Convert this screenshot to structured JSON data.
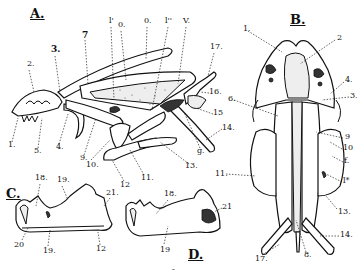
{
  "figures": {
    "A": {
      "title": "A.",
      "labels": [
        {
          "id": "a1",
          "text": "1.",
          "x": 8,
          "y": 145
        },
        {
          "id": "a2",
          "text": "2.",
          "x": 27,
          "y": 63
        },
        {
          "id": "a3",
          "text": "3.",
          "x": 52,
          "y": 47,
          "bold": true
        },
        {
          "id": "a4",
          "text": "4.",
          "x": 56,
          "y": 147
        },
        {
          "id": "a5",
          "text": "5.",
          "x": 35,
          "y": 151
        },
        {
          "id": "a7",
          "text": "7",
          "x": 82,
          "y": 34,
          "bold": true
        },
        {
          "id": "a9",
          "text": "9.",
          "x": 81,
          "y": 158
        },
        {
          "id": "a10",
          "text": "10.",
          "x": 87,
          "y": 163
        },
        {
          "id": "a11",
          "text": "11.",
          "x": 142,
          "y": 178
        },
        {
          "id": "a12",
          "text": "12",
          "x": 121,
          "y": 184
        },
        {
          "id": "a13",
          "text": "13.",
          "x": 186,
          "y": 166
        },
        {
          "id": "a14",
          "text": "14.",
          "x": 223,
          "y": 127
        },
        {
          "id": "a15",
          "text": "15",
          "x": 214,
          "y": 112
        },
        {
          "id": "a16",
          "text": "16.",
          "x": 210,
          "y": 91
        },
        {
          "id": "a17",
          "text": "17.",
          "x": 210,
          "y": 45
        },
        {
          "id": "ag",
          "text": "g.",
          "x": 198,
          "y": 151
        },
        {
          "id": "al1",
          "text": "l'",
          "x": 109,
          "y": 19
        },
        {
          "id": "ao1",
          "text": "0.",
          "x": 119,
          "y": 23
        },
        {
          "id": "ao2",
          "text": "0.",
          "x": 145,
          "y": 19
        },
        {
          "id": "al2",
          "text": "l''",
          "x": 166,
          "y": 19
        },
        {
          "id": "av",
          "text": "V.",
          "x": 184,
          "y": 19
        }
      ]
    },
    "B": {
      "title": "B.",
      "labels": [
        {
          "id": "b1",
          "text": "1.",
          "x": 243,
          "y": 28
        },
        {
          "id": "b2",
          "text": "2",
          "x": 337,
          "y": 37
        },
        {
          "id": "b3",
          "text": "3.",
          "x": 351,
          "y": 95
        },
        {
          "id": "b4",
          "text": "4.",
          "x": 346,
          "y": 79
        },
        {
          "id": "b6",
          "text": "6.",
          "x": 228,
          "y": 97
        },
        {
          "id": "b8",
          "text": "8.",
          "x": 304,
          "y": 254
        },
        {
          "id": "b9",
          "text": "9",
          "x": 345,
          "y": 136
        },
        {
          "id": "b10",
          "text": "10",
          "x": 344,
          "y": 147
        },
        {
          "id": "bf",
          "text": "f.",
          "x": 345,
          "y": 160
        },
        {
          "id": "bl",
          "text": "l*",
          "x": 344,
          "y": 180
        },
        {
          "id": "b11",
          "text": "11.",
          "x": 219,
          "y": 172
        },
        {
          "id": "b13",
          "text": "13.",
          "x": 339,
          "y": 211
        },
        {
          "id": "b14",
          "text": "14.",
          "x": 341,
          "y": 234
        },
        {
          "id": "b17",
          "text": "17.",
          "x": 257,
          "y": 258
        }
      ]
    },
    "C": {
      "title": "C.",
      "labels": [
        {
          "id": "c18",
          "text": "18.",
          "x": 36,
          "y": 176
        },
        {
          "id": "c19a",
          "text": "19.",
          "x": 58,
          "y": 178
        },
        {
          "id": "c21",
          "text": "21.",
          "x": 107,
          "y": 191
        },
        {
          "id": "c20",
          "text": "20",
          "x": 14,
          "y": 243
        },
        {
          "id": "c19b",
          "text": "19.",
          "x": 44,
          "y": 249
        },
        {
          "id": "c12",
          "text": "12",
          "x": 96,
          "y": 247
        }
      ]
    },
    "D": {
      "title": "D.",
      "labels": [
        {
          "id": "d18",
          "text": "18.",
          "x": 165,
          "y": 193
        },
        {
          "id": "d19",
          "text": "19",
          "x": 161,
          "y": 248
        },
        {
          "id": "d21",
          "text": "21",
          "x": 223,
          "y": 206
        }
      ]
    }
  },
  "footer_mark": "-"
}
